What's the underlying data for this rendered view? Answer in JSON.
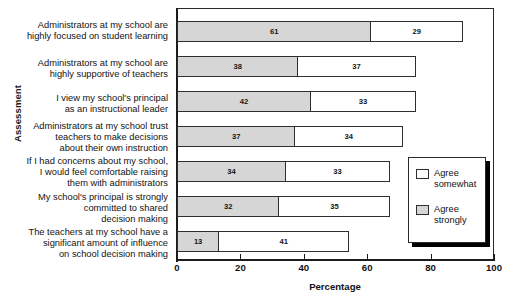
{
  "chart_data": {
    "type": "bar",
    "orientation": "horizontal",
    "stacked": true,
    "title": "",
    "xlabel": "Percentage",
    "ylabel": "Assessment",
    "xlim": [
      0,
      100
    ],
    "xticks": [
      0,
      20,
      40,
      60,
      80,
      100
    ],
    "grid": false,
    "legend_position": "right-bottom-inside",
    "categories": [
      "Administrators at my school are\nhighly focused on student learning",
      "Administrators at my school are\nhighly supportive of teachers",
      "I view my school's principal\nas an instructional leader",
      "Administrators at my school trust\nteachers to make decisions\nabout their own instruction",
      "If I had concerns about my school,\nI would feel comfortable raising\nthem with administrators",
      "My school's principal is strongly\ncommitted to shared\ndecision making",
      "The teachers at my school have a\nsignificant amount of influence\non school decision making"
    ],
    "series": [
      {
        "name": "Agree strongly",
        "color": "#d6d6d6",
        "values": [
          61,
          38,
          42,
          37,
          34,
          32,
          13
        ]
      },
      {
        "name": "Agree somewhat",
        "color": "#ffffff",
        "values": [
          29,
          37,
          33,
          34,
          33,
          35,
          41
        ]
      }
    ],
    "totals": [
      90,
      75,
      75,
      71,
      67,
      67,
      54
    ]
  },
  "legend": {
    "entries": [
      {
        "label": "Agree\nsomewhat",
        "swatch": "somewhat"
      },
      {
        "label": "Agree\nstrongly",
        "swatch": "strong"
      }
    ]
  },
  "colors": {
    "agree_strongly": "#d6d6d6",
    "agree_somewhat": "#ffffff",
    "axis": "#1c1c1c",
    "text": "#131313"
  }
}
